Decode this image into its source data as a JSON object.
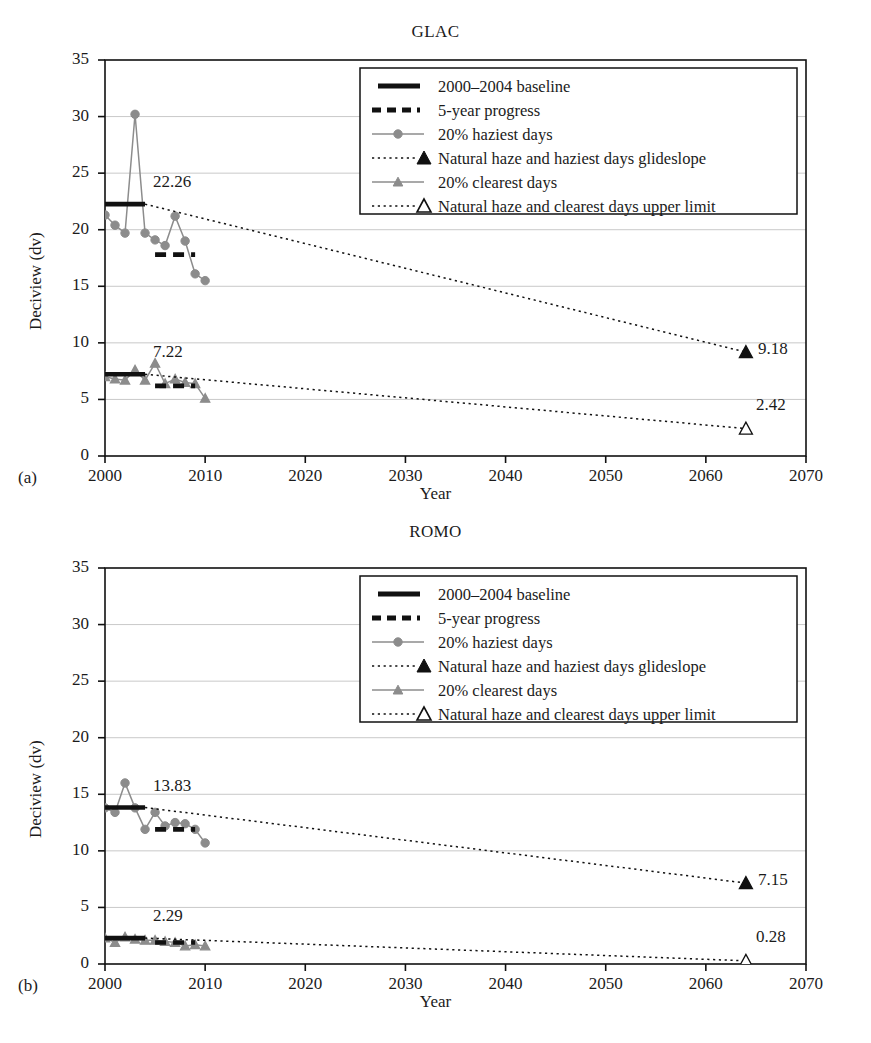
{
  "figure": {
    "panels": [
      {
        "label": "(a)",
        "title": "GLAC",
        "xlabel": "Year",
        "ylabel": "Deciview (dv)"
      },
      {
        "label": "(b)",
        "title": "ROMO",
        "xlabel": "Year",
        "ylabel": "Deciview (dv)"
      }
    ]
  },
  "legend": {
    "items": [
      {
        "key": "baseline",
        "label": "2000–2004 baseline",
        "marker": "thick-solid-line",
        "color": "#000000"
      },
      {
        "key": "progress",
        "label": "5-year progress",
        "marker": "thick-dashed-line",
        "color": "#000000"
      },
      {
        "key": "haziest",
        "label": "20% haziest days",
        "marker": "line-circle",
        "color": "#8c8c8c"
      },
      {
        "key": "haziest_glide",
        "label": "Natural haze and haziest days glideslope",
        "marker": "dotted-line-filled-triangle",
        "color": "#000000"
      },
      {
        "key": "clearest",
        "label": "20% clearest days",
        "marker": "line-triangle",
        "color": "#8c8c8c"
      },
      {
        "key": "clearest_limit",
        "label": "Natural haze and clearest days upper limit",
        "marker": "dotted-line-open-triangle",
        "color": "#000000"
      }
    ]
  },
  "axes": {
    "xticks": [
      2000,
      2010,
      2020,
      2030,
      2040,
      2050,
      2060,
      2070
    ],
    "yticks": [
      0,
      5,
      10,
      15,
      20,
      25,
      30,
      35
    ],
    "xlim": [
      2000,
      2070
    ],
    "ylim": [
      0,
      35
    ],
    "grid": "horizontal"
  },
  "chart_data": [
    {
      "type": "line",
      "panel": "(a)",
      "title": "GLAC",
      "xlabel": "Year",
      "ylabel": "Deciview (dv)",
      "xlim": [
        2000,
        2070
      ],
      "ylim": [
        0,
        35
      ],
      "xticks": [
        2000,
        2010,
        2020,
        2030,
        2040,
        2050,
        2060,
        2070
      ],
      "yticks": [
        0,
        5,
        10,
        15,
        20,
        25,
        30,
        35
      ],
      "grid": true,
      "legend_position": "upper right",
      "series": [
        {
          "name": "20% haziest days",
          "type": "line-marker",
          "color": "#8c8c8c",
          "marker": "circle",
          "x": [
            2000,
            2001,
            2002,
            2003,
            2004,
            2005,
            2006,
            2007,
            2008,
            2009,
            2010
          ],
          "values": [
            21.3,
            20.4,
            19.7,
            30.2,
            19.7,
            19.1,
            18.6,
            21.2,
            19.0,
            16.1,
            15.5
          ]
        },
        {
          "name": "20% clearest days",
          "type": "line-marker",
          "color": "#8c8c8c",
          "marker": "triangle",
          "x": [
            2000,
            2001,
            2002,
            2003,
            2004,
            2005,
            2006,
            2007,
            2008,
            2009,
            2010
          ],
          "values": [
            7.0,
            6.8,
            6.7,
            7.6,
            6.7,
            8.2,
            6.4,
            6.8,
            6.5,
            6.4,
            5.1
          ]
        },
        {
          "name": "2000–2004 baseline (haziest)",
          "type": "hline-segment",
          "color": "#000000",
          "x_start": 2000,
          "x_end": 2004,
          "value": 22.26,
          "value_label": "22.26"
        },
        {
          "name": "2000–2004 baseline (clearest)",
          "type": "hline-segment",
          "color": "#000000",
          "x_start": 2000,
          "x_end": 2004,
          "value": 7.22,
          "value_label": "7.22"
        },
        {
          "name": "5-year progress (haziest)",
          "type": "hline-dashed-segment",
          "color": "#000000",
          "x_start": 2005,
          "x_end": 2009,
          "value": 17.8
        },
        {
          "name": "5-year progress (clearest)",
          "type": "hline-dashed-segment",
          "color": "#000000",
          "x_start": 2005,
          "x_end": 2009,
          "value": 6.2
        },
        {
          "name": "Natural haze and haziest days glideslope",
          "type": "dotted-line",
          "color": "#000000",
          "marker": "filled-triangle",
          "x": [
            2004,
            2064
          ],
          "values": [
            22.26,
            9.18
          ],
          "endpoint_label": "9.18"
        },
        {
          "name": "Natural haze and clearest days upper limit",
          "type": "dotted-line",
          "color": "#000000",
          "marker": "open-triangle",
          "x": [
            2004,
            2064
          ],
          "values": [
            7.22,
            2.42
          ],
          "endpoint_label": "2.42"
        }
      ]
    },
    {
      "type": "line",
      "panel": "(b)",
      "title": "ROMO",
      "xlabel": "Year",
      "ylabel": "Deciview (dv)",
      "xlim": [
        2000,
        2070
      ],
      "ylim": [
        0,
        35
      ],
      "xticks": [
        2000,
        2010,
        2020,
        2030,
        2040,
        2050,
        2060,
        2070
      ],
      "yticks": [
        0,
        5,
        10,
        15,
        20,
        25,
        30,
        35
      ],
      "grid": true,
      "legend_position": "upper right",
      "series": [
        {
          "name": "20% haziest days",
          "type": "line-marker",
          "color": "#8c8c8c",
          "marker": "circle",
          "x": [
            2000,
            2001,
            2002,
            2003,
            2004,
            2005,
            2006,
            2007,
            2008,
            2009,
            2010
          ],
          "values": [
            13.8,
            13.4,
            16.0,
            13.8,
            11.9,
            13.4,
            12.2,
            12.5,
            12.4,
            11.9,
            10.7
          ]
        },
        {
          "name": "20% clearest days",
          "type": "line-marker",
          "color": "#8c8c8c",
          "marker": "triangle",
          "x": [
            2000,
            2001,
            2002,
            2003,
            2004,
            2005,
            2006,
            2007,
            2008,
            2009,
            2010
          ],
          "values": [
            2.3,
            1.9,
            2.4,
            2.2,
            2.1,
            2.1,
            2.0,
            1.9,
            1.6,
            1.7,
            1.6
          ]
        },
        {
          "name": "2000–2004 baseline (haziest)",
          "type": "hline-segment",
          "color": "#000000",
          "x_start": 2000,
          "x_end": 2004,
          "value": 13.83,
          "value_label": "13.83"
        },
        {
          "name": "2000–2004 baseline (clearest)",
          "type": "hline-segment",
          "color": "#000000",
          "x_start": 2000,
          "x_end": 2004,
          "value": 2.29,
          "value_label": "2.29"
        },
        {
          "name": "5-year progress (haziest)",
          "type": "hline-dashed-segment",
          "color": "#000000",
          "x_start": 2005,
          "x_end": 2009,
          "value": 11.9
        },
        {
          "name": "5-year progress (clearest)",
          "type": "hline-dashed-segment",
          "color": "#000000",
          "x_start": 2005,
          "x_end": 2009,
          "value": 1.9
        },
        {
          "name": "Natural haze and haziest days glideslope",
          "type": "dotted-line",
          "color": "#000000",
          "marker": "filled-triangle",
          "x": [
            2004,
            2064
          ],
          "values": [
            13.83,
            7.15
          ],
          "endpoint_label": "7.15"
        },
        {
          "name": "Natural haze and clearest days upper limit",
          "type": "dotted-line",
          "color": "#000000",
          "marker": "open-triangle",
          "x": [
            2004,
            2064
          ],
          "values": [
            2.29,
            0.28
          ],
          "endpoint_label": "0.28"
        }
      ]
    }
  ]
}
